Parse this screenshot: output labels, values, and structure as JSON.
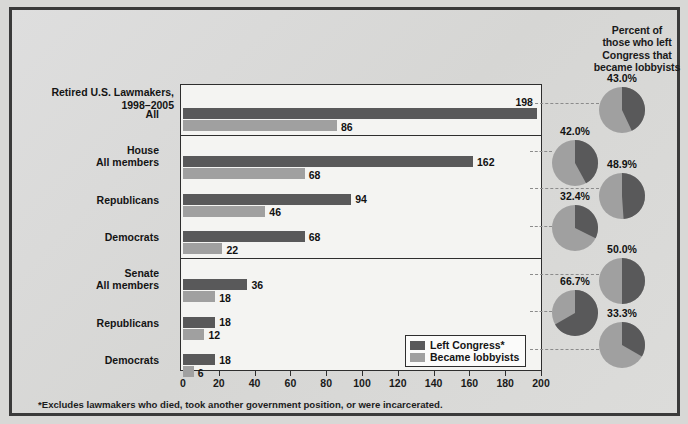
{
  "chart_data": {
    "type": "bar",
    "title": "Retired U.S. Lawmakers, 1998–2005",
    "xlabel": "",
    "ylabel": "",
    "xlim": [
      0,
      200
    ],
    "xticks": [
      0,
      20,
      40,
      60,
      80,
      100,
      120,
      140,
      160,
      180,
      200
    ],
    "grid": false,
    "legend_position": "bottom-right",
    "legend": [
      "Left Congress*",
      "Became lobbyists"
    ],
    "categories": [
      "All",
      "House — All members",
      "House — Republicans",
      "House — Democrats",
      "Senate — All members",
      "Senate — Republicans",
      "Senate — Democrats"
    ],
    "series": [
      {
        "name": "Left Congress*",
        "values": [
          198,
          162,
          94,
          68,
          36,
          18,
          18
        ]
      },
      {
        "name": "Became lobbyists",
        "values": [
          86,
          68,
          46,
          22,
          18,
          12,
          6
        ]
      }
    ],
    "pie_title": "Percent of those who left Congress that became lobbyists",
    "pies": [
      {
        "label": "43.0%",
        "value": 43.0
      },
      {
        "label": "42.0%",
        "value": 42.0
      },
      {
        "label": "48.9%",
        "value": 48.9
      },
      {
        "label": "32.4%",
        "value": 32.4
      },
      {
        "label": "50.0%",
        "value": 50.0
      },
      {
        "label": "66.7%",
        "value": 66.7
      },
      {
        "label": "33.3%",
        "value": 33.3
      }
    ],
    "footnote": "*Excludes lawmakers who died, took another government position, or were incarcerated.",
    "colors": {
      "dark": "#59595a",
      "light": "#a0a0a0",
      "plot_bg": "#f4f4f2",
      "page_bg": "#dcdcda"
    }
  },
  "axis_title_line1": "Retired U.S. Lawmakers,",
  "axis_title_line2": "1998–2005",
  "pies_header": {
    "l1": "Percent of",
    "l2": "those who left",
    "l3": "Congress that",
    "l4": "became lobbyists"
  },
  "rows": [
    {
      "name": "All",
      "head": "",
      "dark": 198,
      "light": 86
    },
    {
      "name": "All members",
      "head": "House",
      "dark": 162,
      "light": 68
    },
    {
      "name": "Republicans",
      "head": "",
      "dark": 94,
      "light": 46
    },
    {
      "name": "Democrats",
      "head": "",
      "dark": 68,
      "light": 22
    },
    {
      "name": "All members",
      "head": "Senate",
      "dark": 36,
      "light": 18
    },
    {
      "name": "Republicans",
      "head": "",
      "dark": 18,
      "light": 12
    },
    {
      "name": "Democrats",
      "head": "",
      "dark": 18,
      "light": 6
    }
  ],
  "xticklabels": [
    "0",
    "20",
    "40",
    "60",
    "80",
    "100",
    "120",
    "140",
    "160",
    "180",
    "200"
  ],
  "legend": {
    "dark_label": "Left Congress*",
    "light_label": "Became lobbyists"
  },
  "footnote": "*Excludes lawmakers who died, took another government position, or were incarcerated."
}
